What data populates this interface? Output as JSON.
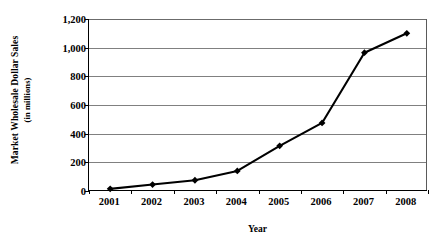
{
  "chart_data": {
    "type": "line",
    "title": "",
    "xlabel": "Year",
    "ylabel": "Market Wholesale Dollar Sales (in millions)",
    "ylabel_line1": "Market Wholesale Dollar Sales",
    "ylabel_line2": "(in millions)",
    "categories": [
      "2001",
      "2002",
      "2003",
      "2004",
      "2005",
      "2006",
      "2007",
      "2008"
    ],
    "values": [
      15,
      45,
      75,
      140,
      315,
      475,
      965,
      1100
    ],
    "series": [
      {
        "name": "Market Wholesale Dollar Sales",
        "values": [
          15,
          45,
          75,
          140,
          315,
          475,
          965,
          1100
        ]
      }
    ],
    "ylim": [
      0,
      1200
    ],
    "ytick_values": [
      0,
      200,
      400,
      600,
      800,
      1000,
      1200
    ],
    "ytick_labels": [
      "0",
      "200",
      "400",
      "600",
      "800",
      "1,000",
      "1,200"
    ],
    "grid": true,
    "legend": false,
    "marker": "diamond",
    "line_color": "#000000",
    "marker_color": "#000000",
    "grid_color": "#808080",
    "axis_color": "#000000",
    "background_color": "#ffffff"
  }
}
